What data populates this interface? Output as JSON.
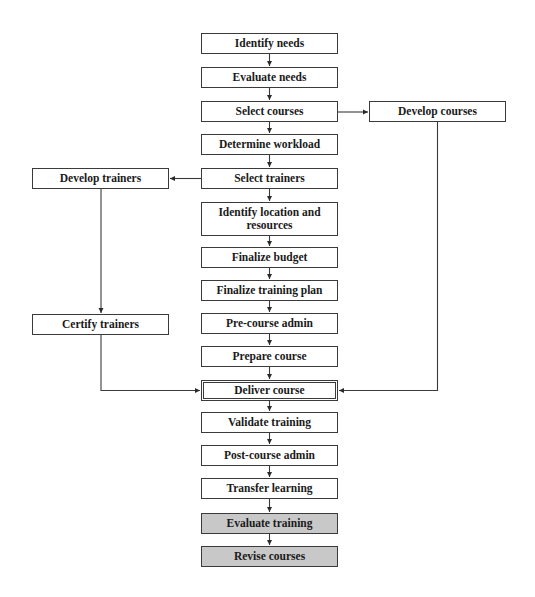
{
  "diagram": {
    "type": "flowchart",
    "nodes": {
      "identify_needs": {
        "label": "Identify needs",
        "style": "plain"
      },
      "evaluate_needs": {
        "label": "Evaluate needs",
        "style": "plain"
      },
      "select_courses": {
        "label": "Select courses",
        "style": "plain"
      },
      "develop_courses": {
        "label": "Develop courses",
        "style": "plain"
      },
      "determine_workload": {
        "label": "Determine workload",
        "style": "plain"
      },
      "select_trainers": {
        "label": "Select trainers",
        "style": "plain"
      },
      "develop_trainers": {
        "label": "Develop trainers",
        "style": "plain"
      },
      "identify_location": {
        "label": "Identify location and resources",
        "style": "plain"
      },
      "finalize_budget": {
        "label": "Finalize budget",
        "style": "plain"
      },
      "finalize_training_plan": {
        "label": "Finalize training plan",
        "style": "plain"
      },
      "certify_trainers": {
        "label": "Certify trainers",
        "style": "plain"
      },
      "pre_course_admin": {
        "label": "Pre-course admin",
        "style": "plain"
      },
      "prepare_course": {
        "label": "Prepare course",
        "style": "plain"
      },
      "deliver_course": {
        "label": "Deliver course",
        "style": "double-border"
      },
      "validate_training": {
        "label": "Validate training",
        "style": "plain"
      },
      "post_course_admin": {
        "label": "Post-course admin",
        "style": "plain"
      },
      "transfer_learning": {
        "label": "Transfer learning",
        "style": "plain"
      },
      "evaluate_training": {
        "label": "Evaluate training",
        "style": "shaded"
      },
      "revise_courses": {
        "label": "Revise courses",
        "style": "shaded"
      }
    },
    "edges": [
      {
        "from": "Identify needs",
        "to": "Evaluate needs"
      },
      {
        "from": "Evaluate needs",
        "to": "Select courses"
      },
      {
        "from": "Select courses",
        "to": "Determine workload"
      },
      {
        "from": "Select courses",
        "to": "Develop courses"
      },
      {
        "from": "Determine workload",
        "to": "Select trainers"
      },
      {
        "from": "Select trainers",
        "to": "Develop trainers"
      },
      {
        "from": "Select trainers",
        "to": "Identify location and resources"
      },
      {
        "from": "Identify location and resources",
        "to": "Finalize budget"
      },
      {
        "from": "Finalize budget",
        "to": "Finalize training plan"
      },
      {
        "from": "Finalize training plan",
        "to": "Pre-course admin"
      },
      {
        "from": "Pre-course admin",
        "to": "Prepare course"
      },
      {
        "from": "Prepare course",
        "to": "Deliver course"
      },
      {
        "from": "Develop trainers",
        "to": "Certify trainers"
      },
      {
        "from": "Certify trainers",
        "to": "Deliver course"
      },
      {
        "from": "Develop courses",
        "to": "Deliver course"
      },
      {
        "from": "Deliver course",
        "to": "Validate training"
      },
      {
        "from": "Validate training",
        "to": "Post-course admin"
      },
      {
        "from": "Post-course admin",
        "to": "Transfer learning"
      },
      {
        "from": "Transfer learning",
        "to": "Evaluate training"
      },
      {
        "from": "Evaluate training",
        "to": "Revise courses"
      }
    ],
    "colors": {
      "border": "#3a3a3a",
      "box_fill": "#ffffff",
      "shaded_fill": "#c8c8c8",
      "text": "#1a1a1a",
      "line": "#3a3a3a"
    }
  }
}
